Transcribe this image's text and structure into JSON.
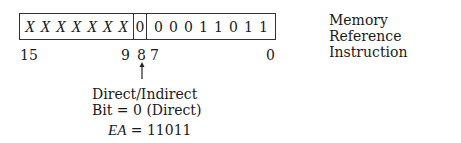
{
  "diagram": {
    "title": "Memory Reference Instruction",
    "title_lines": [
      "Memory Reference",
      "Instruction"
    ],
    "register": {
      "opcode_bits": [
        "X",
        "X",
        "X",
        "X",
        "X",
        "X",
        "X"
      ],
      "di_bit": "0",
      "address_bits": [
        "0",
        "0",
        "0",
        "1",
        "1",
        "0",
        "1",
        "1"
      ]
    },
    "bit_positions": {
      "b15": "15",
      "b9": "9",
      "b8": "8",
      "b7": "7",
      "b0": "0"
    },
    "annotation": {
      "line1": "Direct/Indirect",
      "line2": "Bit = 0 (Direct)",
      "ea_label": "EA",
      "ea_value": "= 11011"
    },
    "arrow_icon": "up-arrow"
  }
}
